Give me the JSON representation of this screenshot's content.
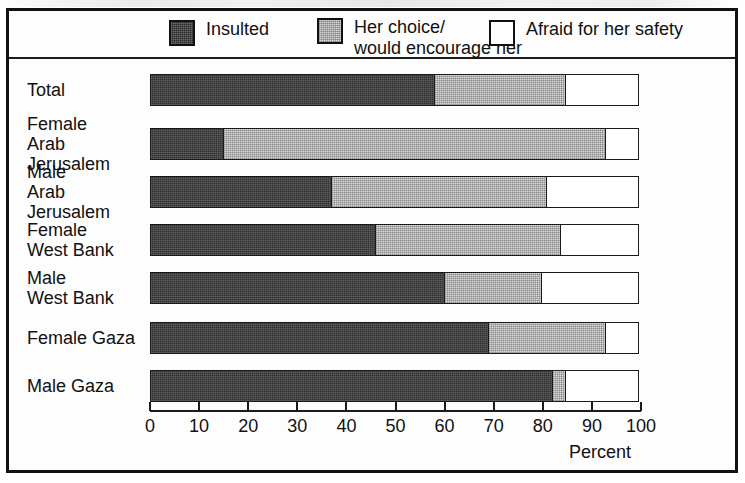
{
  "legend": {
    "items": [
      {
        "label": "Insulted",
        "swatch": "dark-dither-swatch",
        "color": "#2b2b2b"
      },
      {
        "label": "Her choice/\nwould encourage her",
        "swatch": "light-gray-dither-swatch",
        "color": "#d6d6d6"
      },
      {
        "label": "Afraid for her safety",
        "swatch": "white-swatch",
        "color": "#ffffff"
      }
    ]
  },
  "axis": {
    "ticks": [
      "0",
      "10",
      "20",
      "30",
      "40",
      "50",
      "60",
      "70",
      "80",
      "90",
      "100"
    ],
    "title": "Percent"
  },
  "rows": [
    {
      "label": "Total"
    },
    {
      "label": "Female\nArab Jerusalem"
    },
    {
      "label": "Male\nArab Jerusalem"
    },
    {
      "label": "Female\nWest Bank"
    },
    {
      "label": "Male\nWest Bank"
    },
    {
      "label": "Female Gaza"
    },
    {
      "label": "Male Gaza"
    }
  ],
  "chart_data": {
    "type": "bar",
    "orientation": "horizontal",
    "stacked": true,
    "title": "",
    "xlabel": "Percent",
    "ylabel": "",
    "xlim": [
      0,
      100
    ],
    "xticks": [
      0,
      10,
      20,
      30,
      40,
      50,
      60,
      70,
      80,
      90,
      100
    ],
    "grid": false,
    "legend_position": "top",
    "categories": [
      "Total",
      "Female Arab Jerusalem",
      "Male Arab Jerusalem",
      "Female West Bank",
      "Male West Bank",
      "Female Gaza",
      "Male Gaza"
    ],
    "series": [
      {
        "name": "Insulted",
        "values": [
          58,
          15,
          37,
          46,
          60,
          69,
          82
        ]
      },
      {
        "name": "Her choice/would encourage her",
        "values": [
          27,
          78,
          44,
          38,
          20,
          24,
          3
        ]
      },
      {
        "name": "Afraid for her safety",
        "values": [
          15,
          7,
          19,
          16,
          20,
          7,
          15
        ]
      }
    ]
  }
}
